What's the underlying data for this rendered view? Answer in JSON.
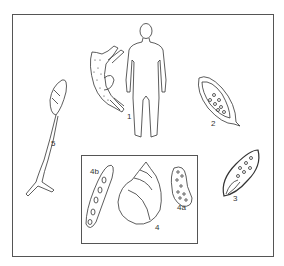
{
  "figure": {
    "labels": {
      "adult_worms_and_human_host": "1",
      "egg_type_a": "2",
      "egg_type_b": "3",
      "snail_host": "4",
      "miracidium_in_snail": "4a",
      "sporocyst": "4b",
      "cercaria": "5"
    }
  }
}
